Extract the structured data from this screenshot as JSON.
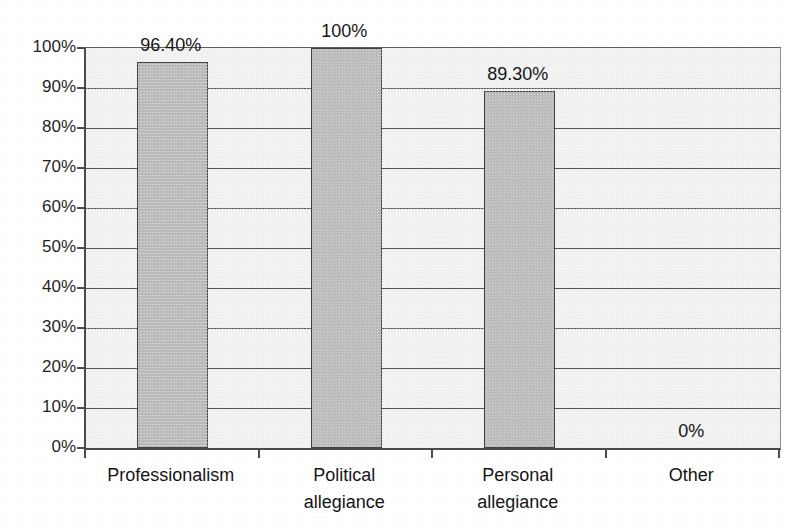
{
  "chart_data": {
    "type": "bar",
    "title": "",
    "subtitle": "",
    "xlabel": "",
    "ylabel": "",
    "categories": [
      "Professionalism",
      "Political\nallegiance",
      "Personal\nallegiance",
      "Other"
    ],
    "values": [
      96.4,
      100,
      89.3,
      0
    ],
    "data_labels": [
      "96.40%",
      "100%",
      "89.30%",
      "0%"
    ],
    "ylim": [
      0,
      100
    ],
    "ytick_values": [
      100,
      90,
      80,
      70,
      60,
      50,
      40,
      30,
      20,
      10,
      0
    ],
    "ytick_labels": [
      "100%",
      "90%",
      "80%",
      "70%",
      "60%",
      "50%",
      "40%",
      "30%",
      "20%",
      "10%",
      "0%"
    ],
    "grid": true,
    "grid_axis": "y",
    "legend": false,
    "legend_position": "none",
    "series": [
      {
        "name": "",
        "values": [
          96.4,
          100,
          89.3,
          0
        ]
      }
    ],
    "colors": {
      "bar_fill": "#b9b9b9",
      "bar_border": "#3f3f3f",
      "plot_background": "#f1f1f1",
      "gridline": "#565656",
      "axis": "#4a4a4a",
      "text": "#141414",
      "page_background": "#ffffff"
    }
  },
  "figure": {
    "title_fragment": "",
    "width": 796,
    "height": 531
  }
}
